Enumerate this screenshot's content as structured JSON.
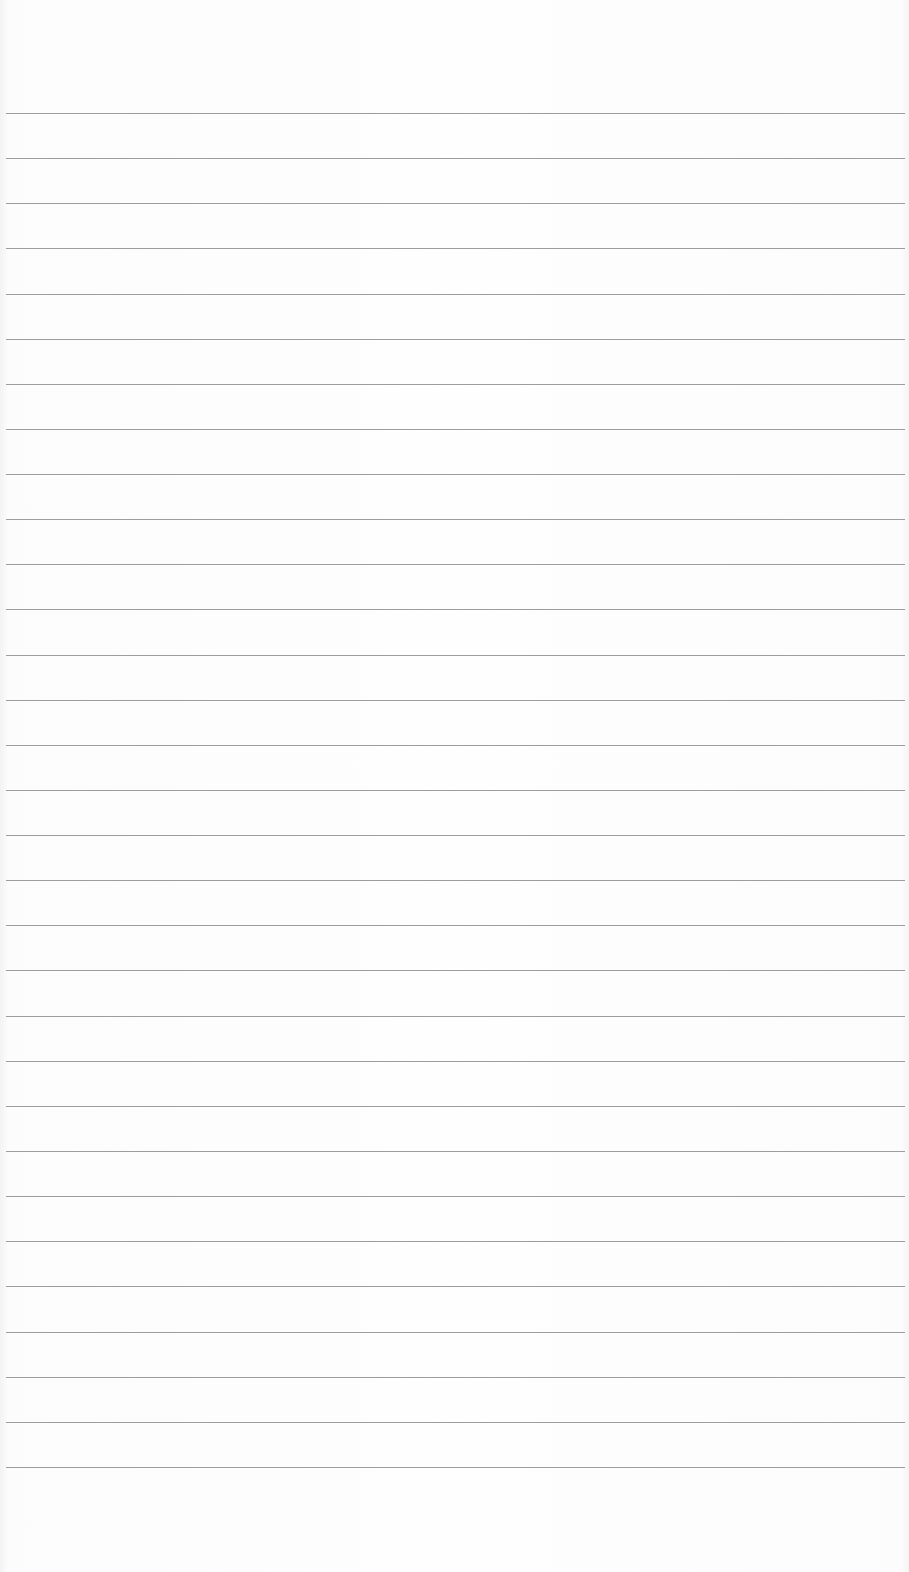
{
  "page": {
    "type": "lined-paper",
    "background_color": "#fdfdfd",
    "rule_color": "#8c8c8c",
    "rule_count": 31,
    "first_rule_y": 113,
    "rule_spacing": 45.13,
    "rule_left": 6,
    "rule_width": 899
  }
}
